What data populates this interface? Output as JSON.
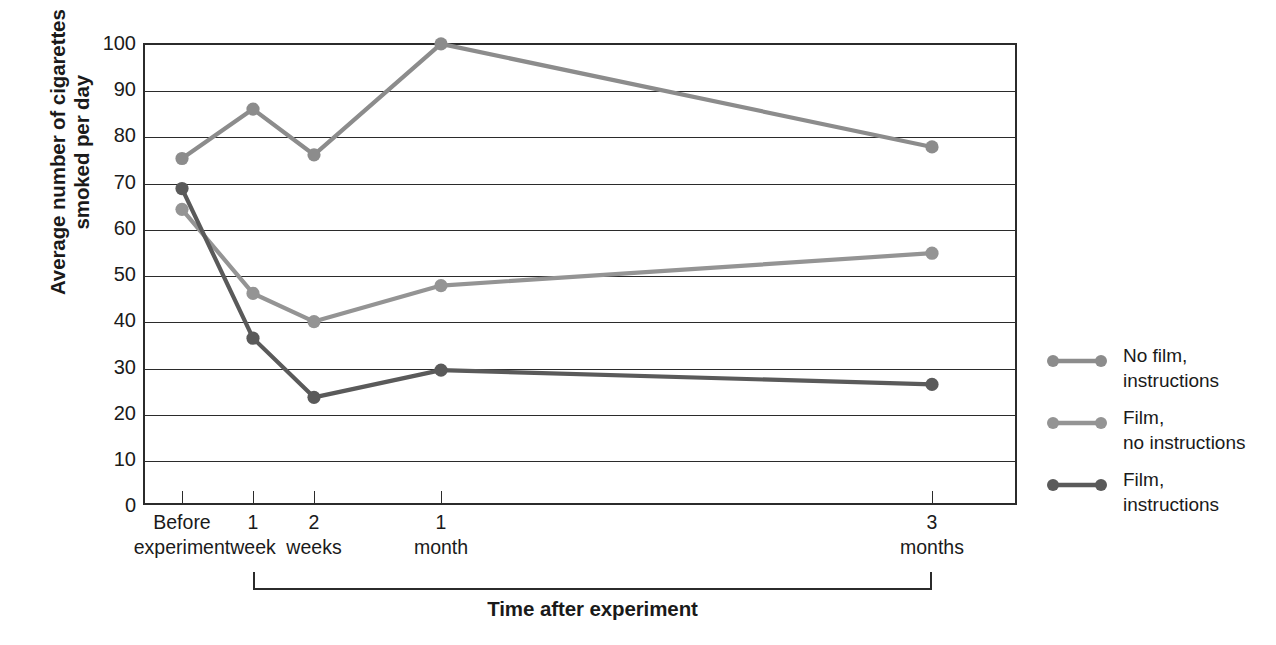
{
  "chart_data": {
    "type": "line",
    "title": "",
    "xlabel": "Time after experiment",
    "ylabel": "Average number of cigarettes\nsmoked per day",
    "categories": [
      "Before\nexperiment",
      "1\nweek",
      "2\nweeks",
      "1\nmonth",
      "3\nmonths"
    ],
    "x_positions": [
      182,
      253,
      314,
      441,
      932
    ],
    "ylim": [
      0,
      100
    ],
    "y_ticks": [
      0,
      10,
      20,
      30,
      40,
      50,
      60,
      70,
      80,
      90,
      100
    ],
    "grid": true,
    "legend_position": "right",
    "series": [
      {
        "name": "No film,\ninstructions",
        "color": "#8c8c8c",
        "values": [
          75.0,
          85.7,
          75.8,
          99.8,
          77.5
        ]
      },
      {
        "name": "Film,\nno instructions",
        "color": "#949494",
        "values": [
          64.0,
          45.8,
          39.7,
          47.5,
          54.5
        ]
      },
      {
        "name": "Film,\ninstructions",
        "color": "#5a5a5a",
        "values": [
          68.5,
          36.1,
          23.3,
          29.2,
          26.1
        ]
      }
    ]
  },
  "axis": {
    "y_title": "Average number of cigarettes\nsmoked per day",
    "x_title": "Time after experiment",
    "y_tick_labels": [
      "100",
      "90",
      "80",
      "70",
      "60",
      "50",
      "40",
      "30",
      "20",
      "10",
      "0"
    ],
    "x_tick_labels": [
      "Before\nexperiment",
      "1\nweek",
      "2\nweeks",
      "1\nmonth",
      "3\nmonths"
    ]
  },
  "legend": {
    "items": [
      {
        "label": "No film,\ninstructions",
        "color": "#8c8c8c"
      },
      {
        "label": "Film,\nno instructions",
        "color": "#949494"
      },
      {
        "label": "Film,\ninstructions",
        "color": "#5a5a5a"
      }
    ]
  },
  "colors": {
    "axis": "#2b2b2b",
    "background": "#ffffff",
    "text": "#1a1a1a"
  }
}
